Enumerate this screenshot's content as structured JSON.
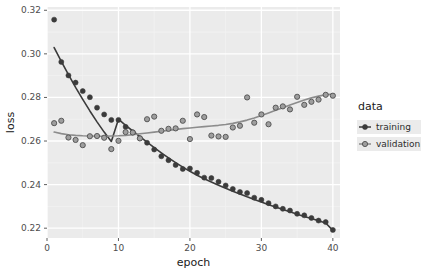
{
  "chart_data": {
    "type": "scatter",
    "title": "",
    "xlabel": "epoch",
    "ylabel": "loss",
    "xlim": [
      0,
      41
    ],
    "ylim": [
      0.2155,
      0.3215
    ],
    "xticks": [
      0,
      10,
      20,
      30,
      40
    ],
    "xtick_labels": [
      "0",
      "10",
      "20",
      "30",
      "40"
    ],
    "yticks": [
      0.22,
      0.24,
      0.26,
      0.28,
      0.3,
      0.32
    ],
    "ytick_labels": [
      "0.22",
      "0.24",
      "0.26",
      "0.28",
      "0.30",
      "0.32"
    ],
    "grid": true,
    "grid_major_color": "#ffffff",
    "grid_minor_color": "#f2f2f2",
    "panel_background": "#ebebeb",
    "legend": {
      "title": "data",
      "position": "right",
      "entries": [
        {
          "name": "training",
          "color": "#3b3b3b",
          "marker": "filled-circle"
        },
        {
          "name": "validation",
          "color": "#8c8c8c",
          "marker": "ringed-circle"
        }
      ]
    },
    "x": [
      1,
      2,
      3,
      4,
      5,
      6,
      7,
      8,
      9,
      10,
      11,
      12,
      13,
      14,
      15,
      16,
      17,
      18,
      19,
      20,
      21,
      22,
      23,
      24,
      25,
      26,
      27,
      28,
      29,
      30,
      31,
      32,
      33,
      34,
      35,
      36,
      37,
      38,
      39,
      40
    ],
    "series": [
      {
        "name": "training",
        "color": "#3b3b3b",
        "marker": "filled-circle",
        "values": [
          0.3157,
          0.2963,
          0.2901,
          0.2868,
          0.2829,
          0.2801,
          0.2753,
          0.2722,
          0.2697,
          0.2697,
          0.2665,
          0.264,
          0.2613,
          0.2592,
          0.2561,
          0.253,
          0.2512,
          0.249,
          0.2472,
          0.2474,
          0.2454,
          0.2432,
          0.243,
          0.2413,
          0.2396,
          0.238,
          0.2366,
          0.2361,
          0.234,
          0.233,
          0.2315,
          0.23,
          0.2289,
          0.2281,
          0.2266,
          0.2259,
          0.2247,
          0.2235,
          0.2228,
          0.2192
        ],
        "smooth": [
          0.3029,
          0.2966,
          0.2905,
          0.2846,
          0.2791,
          0.2738,
          0.2688,
          0.2641,
          0.2598,
          0.27,
          0.2672,
          0.2646,
          0.262,
          0.2595,
          0.257,
          0.2546,
          0.2523,
          0.2501,
          0.248,
          0.2461,
          0.2443,
          0.2427,
          0.2412,
          0.2397,
          0.2383,
          0.237,
          0.2357,
          0.2344,
          0.2332,
          0.232,
          0.2308,
          0.2297,
          0.2286,
          0.2275,
          0.2264,
          0.2254,
          0.2244,
          0.2234,
          0.2224,
          0.219
        ]
      },
      {
        "name": "validation",
        "color": "#8c8c8c",
        "marker": "ringed-circle",
        "values": [
          0.2682,
          0.2693,
          0.2616,
          0.2605,
          0.2581,
          0.2622,
          0.2623,
          0.2615,
          0.2563,
          0.2601,
          0.2641,
          0.2639,
          0.2612,
          0.27,
          0.2712,
          0.2647,
          0.2656,
          0.2658,
          0.2693,
          0.2609,
          0.2722,
          0.271,
          0.2625,
          0.2621,
          0.2619,
          0.2662,
          0.267,
          0.28,
          0.2684,
          0.2722,
          0.2677,
          0.2753,
          0.2759,
          0.2745,
          0.2803,
          0.2766,
          0.278,
          0.279,
          0.2812,
          0.2808
        ],
        "smooth": [
          0.2641,
          0.2634,
          0.2629,
          0.2626,
          0.2624,
          0.2623,
          0.2622,
          0.2622,
          0.2623,
          0.2624,
          0.2626,
          0.2629,
          0.2633,
          0.2637,
          0.2641,
          0.2645,
          0.2649,
          0.2653,
          0.2657,
          0.266,
          0.2663,
          0.2666,
          0.2669,
          0.2672,
          0.2676,
          0.2681,
          0.2688,
          0.2696,
          0.2706,
          0.2717,
          0.2729,
          0.2741,
          0.2753,
          0.2765,
          0.2777,
          0.2788,
          0.2798,
          0.2806,
          0.2812,
          0.2816
        ]
      }
    ]
  }
}
